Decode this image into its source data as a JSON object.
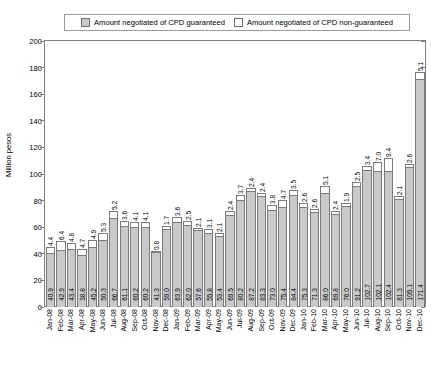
{
  "legend": {
    "entries": [
      {
        "label": "Amount negotiated of CPD guaranteed",
        "swatch": "legend-swatch-guaranteed",
        "color": "#c9c9c9"
      },
      {
        "label": "Amount negotiated of CPD non-guaranteed",
        "swatch": "legend-swatch-nonguaranteed",
        "color": "#ffffff"
      }
    ]
  },
  "chart_data": {
    "type": "bar",
    "title": "",
    "subtitle": "",
    "stacked": true,
    "xlabel": "",
    "ylabel": "Million pesos",
    "ylim": [
      0,
      200
    ],
    "ytick_step": 20,
    "yticks": [
      "0",
      "20",
      "40",
      "60",
      "80",
      "100",
      "120",
      "140",
      "160",
      "180",
      "200"
    ],
    "grid": false,
    "legend_position": "top",
    "categories": [
      "Jan-08",
      "Feb-08",
      "Mar-08",
      "Apr-08",
      "May-08",
      "Jun-08",
      "Jul-08",
      "Aug-08",
      "Sep-08",
      "Oct-08",
      "Nov-08",
      "Dec-08",
      "Jan-09",
      "Feb-09",
      "Mar-09",
      "Apr-09",
      "May-09",
      "Jun-09",
      "Jul-09",
      "Aug-09",
      "Sep-09",
      "Oct-09",
      "Nov-09",
      "Dec-09",
      "Jan-10",
      "Feb-10",
      "Mar-10",
      "Apr-10",
      "May-10",
      "Jun-10",
      "Jul-10",
      "Aug-10",
      "Sep-10",
      "Oct-10",
      "Nov-10",
      "Dec-10"
    ],
    "series": [
      {
        "name": "Amount negotiated of CPD guaranteed",
        "color": "#c9c9c9",
        "values": [
          40.9,
          42.9,
          43.4,
          38.8,
          45.2,
          50.3,
          66.7,
          61.1,
          60.2,
          60.2,
          41.3,
          59.0,
          63.9,
          62.0,
          57.6,
          55.8,
          53.4,
          69.5,
          80.2,
          87.2,
          83.3,
          73.0,
          75.4,
          84.4,
          75.3,
          71.3,
          86.0,
          69.8,
          76.0,
          91.2,
          102.7,
          102.1,
          102.4,
          81.3,
          105.1,
          171.4
        ]
      },
      {
        "name": "Amount negotiated of CPD non-guaranteed",
        "color": "#ffffff",
        "values": [
          4.4,
          6.4,
          4.8,
          4.7,
          4.9,
          5.3,
          5.2,
          3.6,
          4.1,
          4.1,
          0.8,
          1.7,
          3.6,
          2.5,
          2.1,
          3.1,
          2.1,
          2.4,
          3.7,
          2.4,
          2.4,
          3.8,
          4.7,
          3.5,
          2.6,
          2.6,
          5.1,
          2.4,
          1.9,
          2.5,
          3.4,
          7.0,
          9.4,
          2.1,
          2.6,
          5.1
        ]
      }
    ]
  }
}
